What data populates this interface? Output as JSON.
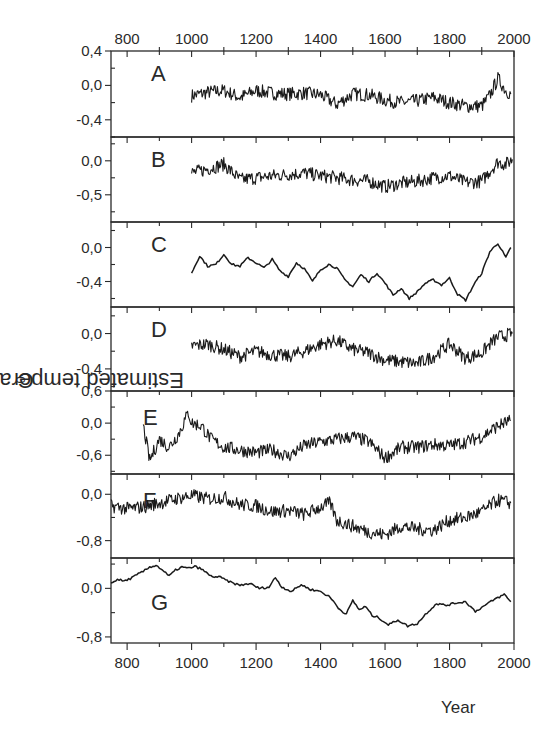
{
  "chart_data": {
    "type": "line",
    "title": "",
    "xlabel": "Year",
    "ylabel": "Estimated temperature anomaly, ",
    "ylabel_unit_sup": "0",
    "ylabel_unit": "C",
    "xlim": [
      750,
      2000
    ],
    "x_ticks_labeled": [
      800,
      1000,
      1200,
      1400,
      1600,
      1800,
      2000
    ],
    "x_ticks_minor": [
      900,
      1100,
      1300,
      1500,
      1700,
      1900
    ],
    "grid": false,
    "legend": "none (panel letters A–G)",
    "panels": [
      {
        "label": "A",
        "ylim": [
          -0.6,
          0.4
        ],
        "yticks": [
          "0,4",
          "0,0",
          "-0,4"
        ],
        "ytick_values": [
          0.4,
          0.0,
          -0.4
        ],
        "style": "noisy",
        "x": [
          1000,
          1050,
          1100,
          1150,
          1200,
          1250,
          1300,
          1350,
          1400,
          1450,
          1500,
          1550,
          1600,
          1650,
          1700,
          1750,
          1800,
          1850,
          1900,
          1925,
          1950,
          1975,
          1990
        ],
        "y": [
          -0.12,
          -0.08,
          -0.06,
          -0.14,
          -0.06,
          -0.09,
          -0.1,
          -0.09,
          -0.11,
          -0.22,
          -0.1,
          -0.11,
          -0.17,
          -0.2,
          -0.18,
          -0.14,
          -0.2,
          -0.24,
          -0.24,
          -0.12,
          0.08,
          -0.06,
          -0.1
        ]
      },
      {
        "label": "B",
        "ylim": [
          -0.9,
          0.35
        ],
        "yticks": [
          "0,0",
          "-0,5"
        ],
        "ytick_values": [
          0.0,
          -0.5
        ],
        "style": "noisy",
        "x": [
          1000,
          1050,
          1100,
          1150,
          1200,
          1250,
          1300,
          1350,
          1400,
          1450,
          1500,
          1550,
          1600,
          1650,
          1700,
          1750,
          1800,
          1850,
          1900,
          1925,
          1950,
          1975,
          1995
        ],
        "y": [
          -0.18,
          -0.12,
          -0.05,
          -0.28,
          -0.25,
          -0.22,
          -0.2,
          -0.18,
          -0.22,
          -0.25,
          -0.28,
          -0.3,
          -0.38,
          -0.33,
          -0.3,
          -0.25,
          -0.22,
          -0.32,
          -0.3,
          -0.15,
          -0.02,
          -0.05,
          0.02
        ]
      },
      {
        "label": "C",
        "ylim": [
          -0.7,
          0.3
        ],
        "yticks": [
          "0,0",
          "-0,4"
        ],
        "ytick_values": [
          0.0,
          -0.4
        ],
        "style": "smooth",
        "x": [
          1000,
          1025,
          1050,
          1075,
          1100,
          1125,
          1150,
          1175,
          1200,
          1225,
          1250,
          1275,
          1300,
          1325,
          1350,
          1375,
          1400,
          1425,
          1450,
          1475,
          1500,
          1525,
          1550,
          1575,
          1600,
          1625,
          1650,
          1675,
          1700,
          1725,
          1750,
          1775,
          1800,
          1825,
          1850,
          1875,
          1900,
          1925,
          1950,
          1975,
          1990
        ],
        "y": [
          -0.3,
          -0.1,
          -0.22,
          -0.2,
          -0.08,
          -0.2,
          -0.22,
          -0.12,
          -0.18,
          -0.24,
          -0.14,
          -0.28,
          -0.34,
          -0.18,
          -0.25,
          -0.4,
          -0.26,
          -0.2,
          -0.24,
          -0.38,
          -0.46,
          -0.32,
          -0.4,
          -0.3,
          -0.42,
          -0.56,
          -0.48,
          -0.6,
          -0.52,
          -0.42,
          -0.38,
          -0.44,
          -0.36,
          -0.55,
          -0.62,
          -0.44,
          -0.3,
          -0.05,
          0.05,
          -0.12,
          0.0
        ]
      },
      {
        "label": "D",
        "ylim": [
          -0.65,
          0.3
        ],
        "yticks": [
          "0,0",
          "-0,4"
        ],
        "ytick_values": [
          0.0,
          -0.4
        ],
        "style": "noisy",
        "x": [
          1000,
          1050,
          1100,
          1150,
          1200,
          1250,
          1300,
          1350,
          1400,
          1450,
          1500,
          1550,
          1600,
          1650,
          1700,
          1750,
          1800,
          1850,
          1900,
          1925,
          1950,
          1975,
          1995
        ],
        "y": [
          -0.14,
          -0.12,
          -0.18,
          -0.26,
          -0.2,
          -0.24,
          -0.26,
          -0.2,
          -0.12,
          -0.08,
          -0.18,
          -0.22,
          -0.3,
          -0.32,
          -0.34,
          -0.26,
          -0.12,
          -0.28,
          -0.22,
          -0.12,
          -0.04,
          -0.02,
          0.0
        ]
      },
      {
        "label": "E",
        "ylim": [
          -0.95,
          0.6
        ],
        "yticks": [
          "0,6",
          "0,0",
          "-0,6"
        ],
        "ytick_values": [
          0.6,
          0.0,
          -0.6
        ],
        "style": "noisy",
        "x": [
          850,
          870,
          900,
          930,
          960,
          990,
          1000,
          1030,
          1060,
          1100,
          1150,
          1200,
          1250,
          1300,
          1350,
          1400,
          1450,
          1500,
          1550,
          1600,
          1650,
          1700,
          1750,
          1800,
          1850,
          1900,
          1950,
          1990
        ],
        "y": [
          -0.05,
          -0.7,
          -0.3,
          -0.45,
          -0.2,
          0.2,
          0.0,
          -0.05,
          -0.3,
          -0.45,
          -0.5,
          -0.55,
          -0.5,
          -0.62,
          -0.42,
          -0.35,
          -0.3,
          -0.25,
          -0.35,
          -0.65,
          -0.45,
          -0.45,
          -0.4,
          -0.42,
          -0.35,
          -0.25,
          -0.05,
          0.05
        ]
      },
      {
        "label": "F",
        "ylim": [
          -1.1,
          0.35
        ],
        "yticks": [
          "0,0",
          "-0,8"
        ],
        "ytick_values": [
          0.0,
          -0.8
        ],
        "style": "noisy",
        "x": [
          750,
          800,
          850,
          900,
          950,
          1000,
          1050,
          1100,
          1150,
          1200,
          1250,
          1300,
          1350,
          1400,
          1430,
          1450,
          1500,
          1550,
          1600,
          1650,
          1700,
          1750,
          1800,
          1850,
          1900,
          1950,
          1990
        ],
        "y": [
          -0.2,
          -0.25,
          -0.22,
          -0.15,
          -0.08,
          -0.02,
          -0.08,
          -0.05,
          -0.18,
          -0.2,
          -0.3,
          -0.28,
          -0.35,
          -0.22,
          -0.15,
          -0.45,
          -0.55,
          -0.65,
          -0.7,
          -0.55,
          -0.6,
          -0.62,
          -0.45,
          -0.4,
          -0.3,
          -0.1,
          -0.15
        ]
      },
      {
        "label": "G",
        "ylim": [
          -0.9,
          0.5
        ],
        "yticks": [
          "0,0",
          "-0,8"
        ],
        "ytick_values": [
          0.0,
          -0.8
        ],
        "style": "smooth",
        "x": [
          750,
          770,
          790,
          810,
          830,
          850,
          870,
          890,
          910,
          930,
          950,
          970,
          990,
          1010,
          1030,
          1060,
          1090,
          1120,
          1150,
          1180,
          1210,
          1240,
          1260,
          1280,
          1310,
          1340,
          1370,
          1400,
          1430,
          1460,
          1480,
          1500,
          1520,
          1540,
          1560,
          1580,
          1610,
          1640,
          1670,
          1700,
          1730,
          1760,
          1790,
          1820,
          1850,
          1880,
          1910,
          1940,
          1970,
          1990
        ],
        "y": [
          0.08,
          0.15,
          0.12,
          0.16,
          0.22,
          0.28,
          0.35,
          0.38,
          0.3,
          0.2,
          0.3,
          0.35,
          0.33,
          0.36,
          0.32,
          0.2,
          0.18,
          0.1,
          0.05,
          0.08,
          0.0,
          0.02,
          0.18,
          0.02,
          -0.05,
          0.06,
          -0.02,
          -0.05,
          -0.15,
          -0.35,
          -0.42,
          -0.2,
          -0.35,
          -0.3,
          -0.45,
          -0.48,
          -0.6,
          -0.52,
          -0.62,
          -0.58,
          -0.4,
          -0.25,
          -0.28,
          -0.24,
          -0.22,
          -0.38,
          -0.28,
          -0.18,
          -0.1,
          -0.22
        ]
      }
    ]
  },
  "axis": {
    "top_ticks": [
      "800",
      "1000",
      "1200",
      "1400",
      "1600",
      "1800",
      "2000"
    ],
    "bottom_ticks": [
      "800",
      "1000",
      "1200",
      "1400",
      "1600",
      "1800",
      "2000"
    ]
  },
  "labels": {
    "ylabel_text": "Estimated temperature anomaly, ",
    "ylabel_sup": "0",
    "ylabel_unit": "C",
    "xlabel_text": "Year"
  },
  "colors": {
    "line": "#1a1a1a",
    "axis": "#2a2a2a",
    "background": "#ffffff"
  }
}
